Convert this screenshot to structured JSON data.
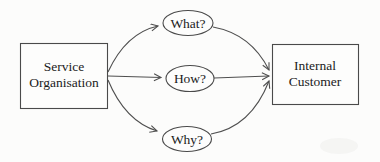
{
  "diagram": {
    "source_box": {
      "label": "Service Organisation",
      "label_lines": [
        "Service",
        "Organisation"
      ]
    },
    "target_box": {
      "label": "Internal Customer",
      "label_lines": [
        "Internal",
        "Customer"
      ]
    },
    "question_nodes": [
      {
        "id": "what",
        "label": "What?"
      },
      {
        "id": "how",
        "label": "How?"
      },
      {
        "id": "why",
        "label": "Why?"
      }
    ],
    "edges": [
      {
        "from": "service-organisation",
        "to": "what"
      },
      {
        "from": "service-organisation",
        "to": "how"
      },
      {
        "from": "service-organisation",
        "to": "why"
      },
      {
        "from": "what",
        "to": "internal-customer"
      },
      {
        "from": "how",
        "to": "internal-customer"
      },
      {
        "from": "why",
        "to": "internal-customer"
      }
    ],
    "colors": {
      "background": "#fcfcfb",
      "line": "#4a4a4a",
      "text": "#1b1b1b"
    }
  }
}
